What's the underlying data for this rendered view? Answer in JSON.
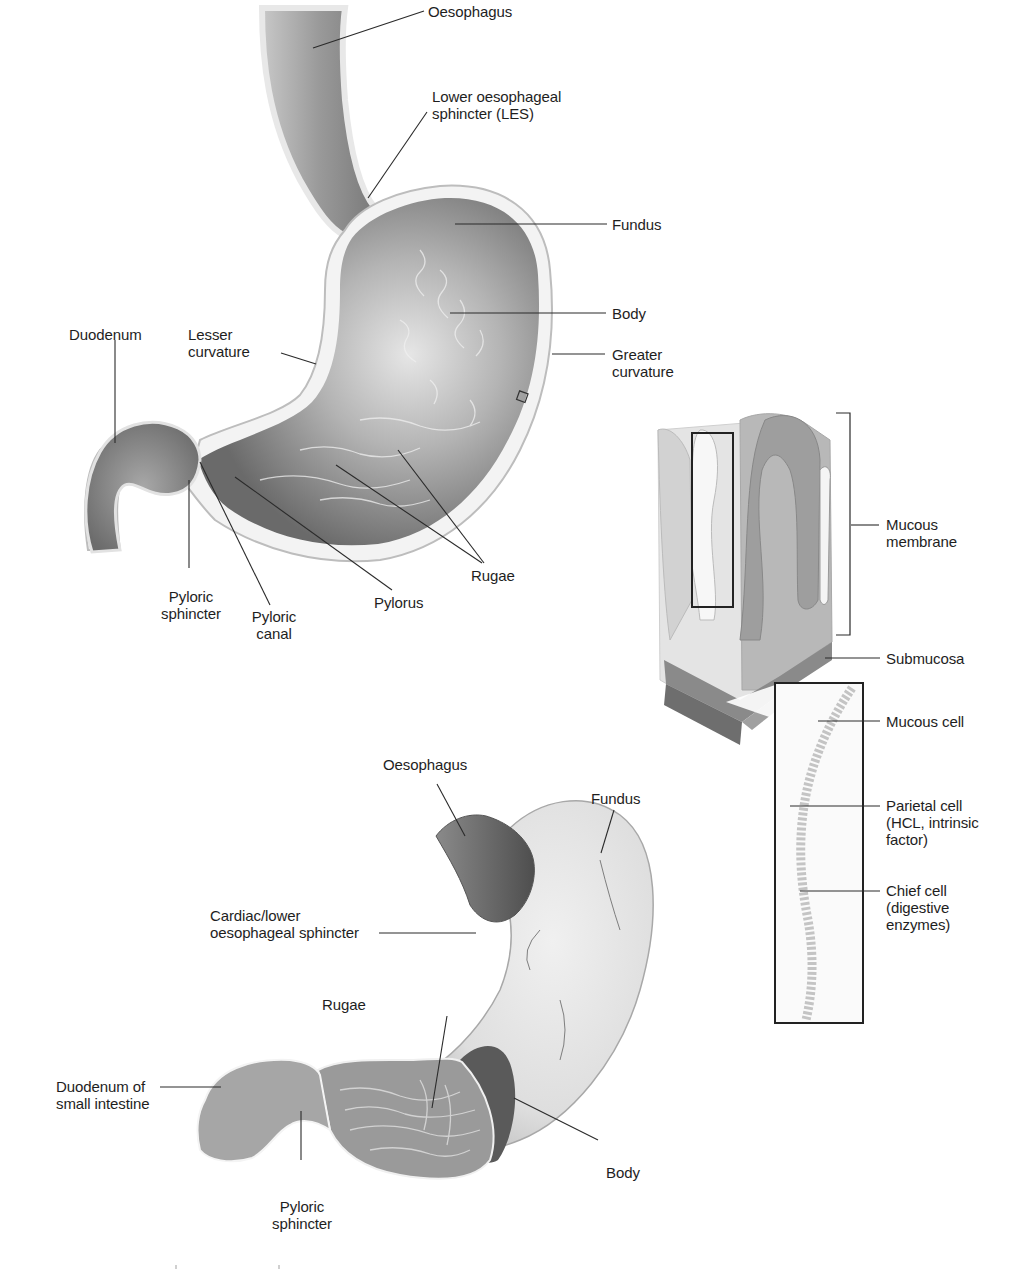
{
  "figure": {
    "panels": [
      {
        "id": "stomach-cross-section",
        "labels": {
          "oesophagus": "Oesophagus",
          "les": "Lower oesophageal\nsphincter (LES)",
          "fundus": "Fundus",
          "body": "Body",
          "greater_curvature": "Greater\ncurvature",
          "lesser_curvature": "Lesser\ncurvature",
          "duodenum": "Duodenum",
          "pyloric_sphincter": "Pyloric\nsphincter",
          "pyloric_canal": "Pyloric\ncanal",
          "pylorus": "Pylorus",
          "rugae": "Rugae"
        }
      },
      {
        "id": "stomach-wall-histology",
        "labels": {
          "mucous_membrane": "Mucous\nmembrane",
          "submucosa": "Submucosa",
          "mucous_cell": "Mucous cell",
          "parietal_cell": "Parietal cell\n(HCL, intrinsic\nfactor)",
          "chief_cell": "Chief cell\n(digestive\nenzymes)"
        }
      },
      {
        "id": "stomach-external-view",
        "labels": {
          "oesophagus": "Oesophagus",
          "fundus": "Fundus",
          "cardiac_sphincter": "Cardiac/lower\noesophageal sphincter",
          "rugae": "Rugae",
          "duodenum": "Duodenum of\nsmall intestine",
          "body": "Body",
          "pyloric_sphincter": "Pyloric\nsphincter"
        }
      }
    ],
    "colors": {
      "background": "#ffffff",
      "tissue_dark": "#6e6e6e",
      "tissue_mid": "#9a9a9a",
      "tissue_light": "#d9d9d9",
      "wall_highlight": "#f2f2f2",
      "leader_line": "#2a2a2a"
    }
  }
}
